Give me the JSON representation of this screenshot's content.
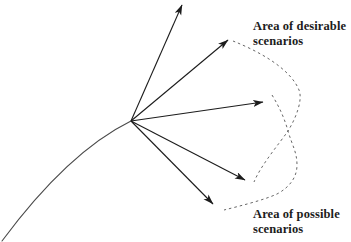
{
  "figure": {
    "type": "diagram",
    "colors": {
      "background": "#ffffff",
      "ink": "#1c1c1c",
      "trajectory": "#4a4a4a",
      "dashed_boundary": "#666666"
    },
    "origin": {
      "x": 131,
      "y": 121
    },
    "arrows": [
      {
        "name": "scenario-arrow-1",
        "tip": {
          "x": 182,
          "y": 5
        }
      },
      {
        "name": "scenario-arrow-2",
        "tip": {
          "x": 228,
          "y": 40
        }
      },
      {
        "name": "scenario-arrow-3",
        "tip": {
          "x": 263,
          "y": 102
        }
      },
      {
        "name": "scenario-arrow-4",
        "tip": {
          "x": 245,
          "y": 180
        }
      },
      {
        "name": "scenario-arrow-5",
        "tip": {
          "x": 213,
          "y": 204
        }
      }
    ],
    "paths": {
      "trajectory": "M 2 241 Q 68 152 131 121",
      "desirable_boundary": "M 233 41 C 258 51 290 68 299 90 C 303 100 296 118 288 131 C 279 144 261 165 254 182",
      "possible_boundary": "M 272 95 C 280 108 285 120 288 131 C 292 145 297 152 297 165 C 297 177 290 187 277 194 C 264 200 240 206 224 210"
    },
    "labels": {
      "desirable": {
        "line1": "Area of desirable",
        "line2": "scenarios"
      },
      "possible": {
        "line1": "Area of possible",
        "line2": "scenarios"
      }
    }
  }
}
